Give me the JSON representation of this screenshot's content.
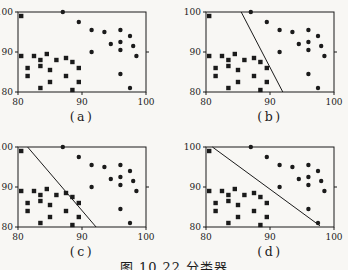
{
  "page": {
    "caption": "图 10.22  分类器",
    "background": "#f8f7f4",
    "ink": "#1b1b1b"
  },
  "chart_data": {
    "type": "scatter",
    "title": "图 10.22  分类器",
    "xlim": [
      80,
      100
    ],
    "ylim": [
      80,
      100
    ],
    "xticks": [
      "80",
      "90",
      "100"
    ],
    "yticks": [
      "80",
      "90",
      "100"
    ],
    "xtick_values": [
      80,
      90,
      100
    ],
    "ytick_values": [
      80,
      90,
      100
    ],
    "grid": false,
    "legend": null,
    "series": [
      {
        "name": "class-squares",
        "marker": "square",
        "color": "#1b1b1b",
        "points": [
          [
            80.5,
            99
          ],
          [
            80.5,
            89
          ],
          [
            82.5,
            89
          ],
          [
            84.5,
            89.5
          ],
          [
            83.5,
            88
          ],
          [
            86,
            88
          ],
          [
            87.5,
            88.5
          ],
          [
            88.5,
            87.5
          ],
          [
            81.5,
            86
          ],
          [
            83.5,
            86.5
          ],
          [
            85,
            85.5
          ],
          [
            89.5,
            86
          ],
          [
            81.5,
            84
          ],
          [
            87.5,
            84
          ],
          [
            85,
            82.5
          ],
          [
            89.5,
            82.5
          ],
          [
            83.5,
            81
          ],
          [
            88.5,
            80.5
          ]
        ]
      },
      {
        "name": "class-circles",
        "marker": "circle",
        "color": "#1b1b1b",
        "points": [
          [
            87,
            100
          ],
          [
            89.5,
            97.5
          ],
          [
            91.5,
            95.5
          ],
          [
            93.5,
            95
          ],
          [
            96,
            95.5
          ],
          [
            97.5,
            94
          ],
          [
            96,
            92.5
          ],
          [
            98,
            91.5
          ],
          [
            94.5,
            92
          ],
          [
            91.5,
            90
          ],
          [
            96,
            90.5
          ],
          [
            98.5,
            89
          ],
          [
            96,
            84.5
          ],
          [
            97.5,
            81
          ]
        ]
      }
    ],
    "subplots": [
      {
        "label": "(a)",
        "separator_line": null
      },
      {
        "label": "(b)",
        "separator_line": [
          [
            85.5,
            100
          ],
          [
            92,
            80
          ]
        ]
      },
      {
        "label": "(c)",
        "separator_line": [
          [
            81.5,
            100
          ],
          [
            92.2,
            80
          ]
        ]
      },
      {
        "label": "(d)",
        "separator_line": [
          [
            81,
            100
          ],
          [
            97.8,
            80.3
          ]
        ]
      }
    ]
  }
}
